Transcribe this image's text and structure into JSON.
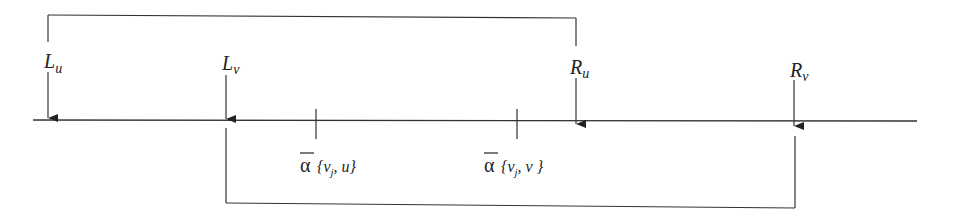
{
  "diagram": {
    "type": "interval-timeline",
    "line_color": "#333333",
    "markers": [
      {
        "id": "Lu",
        "base": "L",
        "sub": "u",
        "x": 48
      },
      {
        "id": "Lv",
        "base": "L",
        "sub": "v",
        "x": 226
      },
      {
        "id": "Ru",
        "base": "R",
        "sub": "u",
        "x": 576
      },
      {
        "id": "Rv",
        "base": "R",
        "sub": "v",
        "x": 794
      }
    ],
    "ticks": [
      {
        "id": "alpha-vj-u",
        "x": 316,
        "symbol": "α",
        "args": "{v",
        "sub": "j",
        "rest": ", u}"
      },
      {
        "id": "alpha-vj-v",
        "x": 517,
        "symbol": "α",
        "args": "{v",
        "sub": "j",
        "rest": ", v }"
      }
    ],
    "brackets": [
      {
        "id": "interval-u",
        "from": "Lu",
        "to": "Ru",
        "position": "above"
      },
      {
        "id": "interval-v",
        "from": "Lv",
        "to": "Rv",
        "position": "below"
      }
    ]
  }
}
